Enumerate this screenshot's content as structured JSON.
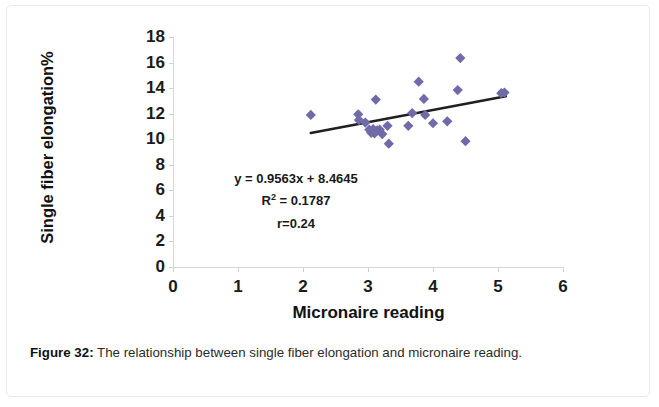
{
  "figure": {
    "caption_label": "Figure 32",
    "caption_sep": ":",
    "caption_text": "The relationship between single fiber elongation and micronaire reading."
  },
  "chart_data": {
    "type": "scatter",
    "title": "",
    "xlabel": "Micronaire reading",
    "ylabel": "Single  fiber elongation%",
    "xlim": [
      0,
      6
    ],
    "ylim": [
      0,
      18
    ],
    "xticks": [
      0,
      1,
      2,
      3,
      4,
      5,
      6
    ],
    "yticks": [
      0,
      2,
      4,
      6,
      8,
      10,
      12,
      14,
      16,
      18
    ],
    "xtick_labels": [
      "0",
      "1",
      "2",
      "3",
      "4",
      "5",
      "6"
    ],
    "ytick_labels": [
      "0",
      "2",
      "4",
      "6",
      "8",
      "10",
      "12",
      "14",
      "16",
      "18"
    ],
    "grid": false,
    "legend": false,
    "marker": "diamond",
    "marker_color": "#6f6aa8",
    "marker_size": 7,
    "points": [
      {
        "x": 2.12,
        "y": 11.9
      },
      {
        "x": 2.85,
        "y": 11.95
      },
      {
        "x": 2.86,
        "y": 11.5
      },
      {
        "x": 2.96,
        "y": 11.3
      },
      {
        "x": 3.02,
        "y": 10.75
      },
      {
        "x": 3.05,
        "y": 10.5
      },
      {
        "x": 3.08,
        "y": 10.8
      },
      {
        "x": 3.1,
        "y": 10.45
      },
      {
        "x": 3.14,
        "y": 10.7
      },
      {
        "x": 3.18,
        "y": 10.75
      },
      {
        "x": 3.22,
        "y": 10.4
      },
      {
        "x": 3.3,
        "y": 11.05
      },
      {
        "x": 3.32,
        "y": 9.65
      },
      {
        "x": 3.12,
        "y": 13.1
      },
      {
        "x": 3.62,
        "y": 11.05
      },
      {
        "x": 3.68,
        "y": 12.05
      },
      {
        "x": 3.78,
        "y": 14.5
      },
      {
        "x": 3.86,
        "y": 13.15
      },
      {
        "x": 3.88,
        "y": 11.9
      },
      {
        "x": 4.0,
        "y": 11.25
      },
      {
        "x": 4.22,
        "y": 11.4
      },
      {
        "x": 4.38,
        "y": 13.85
      },
      {
        "x": 4.42,
        "y": 16.35
      },
      {
        "x": 4.5,
        "y": 9.85
      },
      {
        "x": 5.05,
        "y": 13.6
      },
      {
        "x": 5.1,
        "y": 13.65
      }
    ],
    "trendline": {
      "type": "linear",
      "slope": 0.9563,
      "intercept": 8.4645,
      "x_start": 2.12,
      "x_end": 5.12,
      "color": "#231f20",
      "width": 2.6
    },
    "annotations": {
      "equation": "y = 0.9563x + 8.4645",
      "r_squared_prefix": "R",
      "r_squared_exp": "2",
      "r_squared_value": " = 0.1787",
      "r_value": "r=0.24"
    }
  }
}
